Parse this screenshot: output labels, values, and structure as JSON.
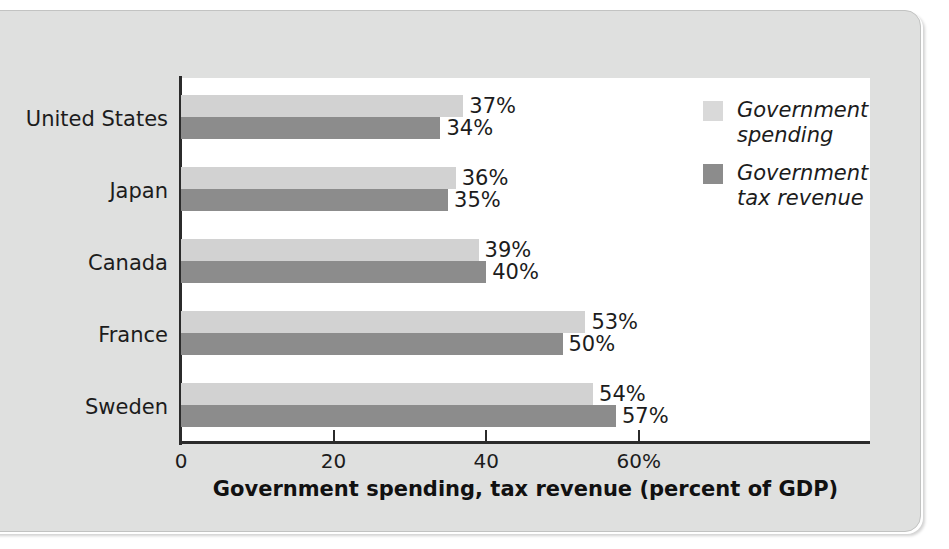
{
  "chart_data": {
    "type": "bar",
    "orientation": "horizontal",
    "title": "",
    "xlabel": "Government spending, tax revenue (percent of GDP)",
    "ylabel": "",
    "categories": [
      "United States",
      "Japan",
      "Canada",
      "France",
      "Sweden"
    ],
    "series": [
      {
        "name": "Government spending",
        "color": "#d2d2d2",
        "values": [
          37,
          36,
          39,
          53,
          54
        ],
        "labels": [
          "37%",
          "36%",
          "39%",
          "53%",
          "54%"
        ]
      },
      {
        "name": "Government tax revenue",
        "color": "#8c8c8c",
        "values": [
          34,
          35,
          40,
          50,
          57
        ],
        "labels": [
          "34%",
          "35%",
          "40%",
          "50%",
          "57%"
        ]
      }
    ],
    "xlim": [
      0,
      66
    ],
    "xticks": [
      0,
      20,
      40,
      60
    ],
    "xtick_labels": [
      "0",
      "20",
      "40",
      "60%"
    ],
    "grid": false,
    "legend_position": "top-right"
  },
  "legend": {
    "items": [
      {
        "label": "Government\nspending",
        "color": "#d2d2d2"
      },
      {
        "label": "Government\ntax revenue",
        "color": "#8c8c8c"
      }
    ]
  },
  "colors": {
    "page_background": "#dfe0df",
    "plot_background": "#ffffff",
    "axis": "#2b2b2b",
    "text": "#1c1c1c",
    "spending": "#d2d2d2",
    "revenue": "#8c8c8c"
  }
}
